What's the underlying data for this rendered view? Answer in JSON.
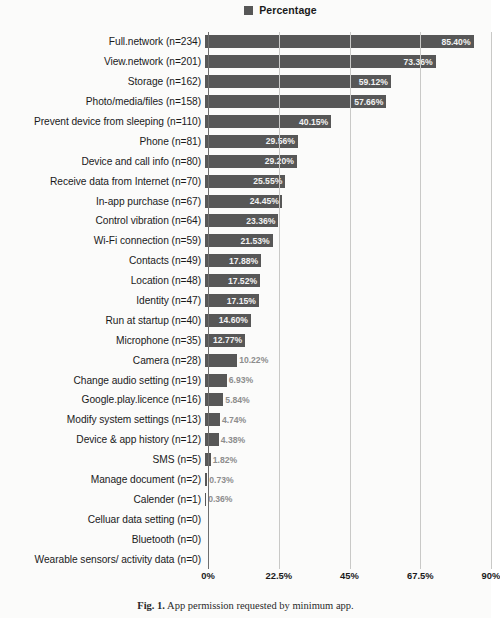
{
  "legend": {
    "entries": [
      {
        "label": "Percentage",
        "color": "#575757",
        "marker": "square-swatch"
      }
    ]
  },
  "caption": {
    "figure_number": "Fig. 1.",
    "text": "App permission requested by minimum app."
  },
  "colors": {
    "bar": "#575757",
    "gridline": "#c9c9c7",
    "axis": "#6e6e6e",
    "background": "#fbfbfa",
    "value_label_inside": "#f2f2f2",
    "value_label_outside": "#8d8d8d"
  },
  "chart_data": {
    "type": "bar",
    "orientation": "horizontal",
    "title": "",
    "xlabel": "",
    "ylabel": "",
    "xlim": [
      0,
      90
    ],
    "xticks": [
      "0%",
      "22.5%",
      "45%",
      "67.5%",
      "90%"
    ],
    "xtick_values": [
      0,
      22.5,
      45,
      67.5,
      90
    ],
    "grid": true,
    "grid_axis": "x",
    "legend_position": "top-center",
    "series_name": "Percentage",
    "categories": [
      "Full.network (n=234)",
      "View.network (n=201)",
      "Storage (n=162)",
      "Photo/media/files (n=158)",
      "Prevent device from sleeping (n=110)",
      "Phone (n=81)",
      "Device and call info (n=80)",
      "Receive data from Internet (n=70)",
      "In-app purchase (n=67)",
      "Control vibration (n=64)",
      "Wi-Fi connection (n=59)",
      "Contacts (n=49)",
      "Location (n=48)",
      "Identity (n=47)",
      "Run at startup (n=40)",
      "Microphone (n=35)",
      "Camera (n=28)",
      "Change audio setting (n=19)",
      "Google.play.licence (n=16)",
      "Modify system settings (n=13)",
      "Device & app history (n=12)",
      "SMS (n=5)",
      "Manage document (n=2)",
      "Calender (n=1)",
      "Celluar data setting (n=0)",
      "Bluetooth (n=0)",
      "Wearable sensors/ activity data (n=0)"
    ],
    "values": [
      85.4,
      73.36,
      59.12,
      57.66,
      40.15,
      29.56,
      29.2,
      25.55,
      24.45,
      23.36,
      21.53,
      17.88,
      17.52,
      17.15,
      14.6,
      12.77,
      10.22,
      6.93,
      5.84,
      4.74,
      4.38,
      1.82,
      0.73,
      0.36,
      0,
      0,
      0
    ],
    "value_labels": [
      "85.40%",
      "73.36%",
      "59.12%",
      "57.66%",
      "40.15%",
      "29.56%",
      "29.20%",
      "25.55%",
      "24.45%",
      "23.36%",
      "21.53%",
      "17.88%",
      "17.52%",
      "17.15%",
      "14.60%",
      "12.77%",
      "10.22%",
      "6.93%",
      "5.84%",
      "4.74%",
      "4.38%",
      "1.82%",
      "0.73%",
      "0.36%",
      "",
      "",
      ""
    ],
    "counts": [
      234,
      201,
      162,
      158,
      110,
      81,
      80,
      70,
      67,
      64,
      59,
      49,
      48,
      47,
      40,
      35,
      28,
      19,
      16,
      13,
      12,
      5,
      2,
      1,
      0,
      0,
      0
    ]
  }
}
